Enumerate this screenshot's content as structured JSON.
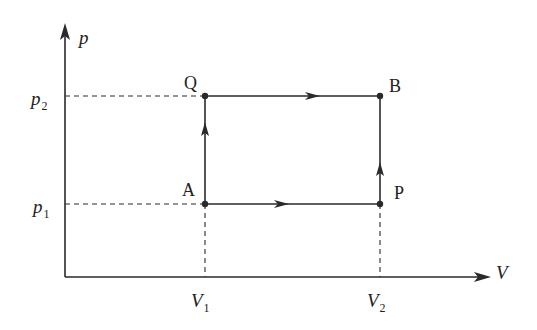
{
  "diagram": {
    "type": "pv-diagram",
    "axes": {
      "y_label": "p",
      "x_label": "V",
      "y_ticks": [
        {
          "label": "p",
          "sub": "2",
          "name": "p2"
        },
        {
          "label": "p",
          "sub": "1",
          "name": "p1"
        }
      ],
      "x_ticks": [
        {
          "label": "V",
          "sub": "1",
          "name": "V1"
        },
        {
          "label": "V",
          "sub": "2",
          "name": "V2"
        }
      ]
    },
    "points": [
      {
        "label": "Q",
        "V": "V1",
        "p": "p2"
      },
      {
        "label": "B",
        "V": "V2",
        "p": "p2"
      },
      {
        "label": "A",
        "V": "V1",
        "p": "p1"
      },
      {
        "label": "P",
        "V": "V2",
        "p": "p1"
      }
    ],
    "paths": [
      {
        "from": "A",
        "to": "Q",
        "direction": "up"
      },
      {
        "from": "Q",
        "to": "B",
        "direction": "right"
      },
      {
        "from": "A",
        "to": "P",
        "direction": "right"
      },
      {
        "from": "P",
        "to": "B",
        "direction": "up"
      }
    ],
    "colors": {
      "line": "#2a2a2a",
      "background": "#ffffff"
    }
  }
}
